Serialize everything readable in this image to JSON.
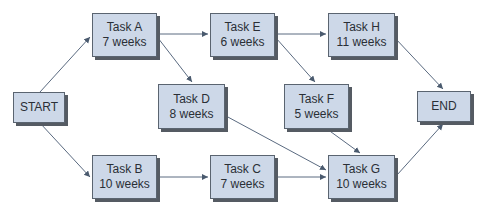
{
  "diagram": {
    "type": "network-diagram",
    "colors": {
      "node_fill": "#cdd8e8",
      "node_border": "#5a6470",
      "shadow": "#555b63",
      "edge": "#4a5a6e",
      "text": "#2a2f36"
    },
    "nodes": [
      {
        "id": "start",
        "label": "START",
        "duration": ""
      },
      {
        "id": "a",
        "label": "Task A",
        "duration": "7 weeks"
      },
      {
        "id": "b",
        "label": "Task B",
        "duration": "10 weeks"
      },
      {
        "id": "c",
        "label": "Task C",
        "duration": "7 weeks"
      },
      {
        "id": "d",
        "label": "Task D",
        "duration": "8 weeks"
      },
      {
        "id": "e",
        "label": "Task E",
        "duration": "6 weeks"
      },
      {
        "id": "f",
        "label": "Task F",
        "duration": "5 weeks"
      },
      {
        "id": "g",
        "label": "Task G",
        "duration": "10 weeks"
      },
      {
        "id": "h",
        "label": "Task H",
        "duration": "11 weeks"
      },
      {
        "id": "end",
        "label": "END",
        "duration": ""
      }
    ],
    "edges": [
      [
        "START",
        "Task A"
      ],
      [
        "START",
        "Task B"
      ],
      [
        "Task A",
        "Task E"
      ],
      [
        "Task A",
        "Task D"
      ],
      [
        "Task E",
        "Task H"
      ],
      [
        "Task E",
        "Task F"
      ],
      [
        "Task D",
        "Task G"
      ],
      [
        "Task F",
        "Task G"
      ],
      [
        "Task B",
        "Task C"
      ],
      [
        "Task C",
        "Task G"
      ],
      [
        "Task H",
        "END"
      ],
      [
        "Task G",
        "END"
      ]
    ]
  }
}
